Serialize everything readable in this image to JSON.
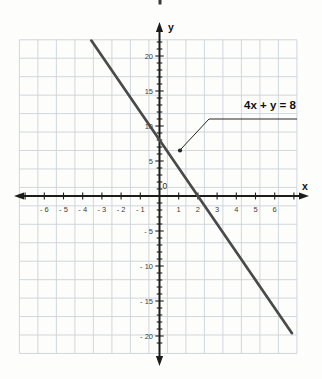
{
  "page": {
    "background": "#fdfdfb"
  },
  "chart_data": {
    "type": "line",
    "title": "",
    "equation_label": "4x + y = 8",
    "xlabel": "x",
    "ylabel": "y",
    "origin_label": "0",
    "grid": true,
    "x_axis": {
      "min": -7.5,
      "max": 7.7,
      "tick_step": 1,
      "labeled_ticks": [
        -6,
        -5,
        -4,
        -3,
        -2,
        -1,
        1,
        2,
        3,
        4,
        5,
        6
      ],
      "tick_label_texts": [
        "- 6",
        "- 5",
        "- 4",
        "- 3",
        "- 2",
        "- 1",
        "1",
        "2",
        "3",
        "4",
        "5",
        "6"
      ]
    },
    "y_axis": {
      "min": -23,
      "max": 24,
      "tick_step": 1,
      "label_step": 5,
      "labeled_ticks": [
        20,
        15,
        10,
        5,
        -5,
        -10,
        -15,
        -20
      ],
      "tick_label_texts": [
        "20",
        "15",
        "10",
        "5",
        "- 5",
        "- 10",
        "- 15",
        "- 20"
      ]
    },
    "series": [
      {
        "name": "4x + y = 8",
        "equation": "y = 8 - 4x",
        "slope": -4,
        "intercept": 8,
        "x_range": [
          -3.55,
          6.9
        ],
        "key_points": [
          {
            "x": 0,
            "y": 8,
            "note": "y-intercept"
          },
          {
            "x": 2,
            "y": 0,
            "note": "x-intercept"
          }
        ],
        "color": "#4a4a4a"
      }
    ],
    "annotation": {
      "text": "4x + y = 8",
      "points_to": {
        "x": 1,
        "y": 6
      }
    },
    "legend": null,
    "colors": {
      "grid": "#ccd2d9",
      "axis": "#1c1c1c",
      "tick_label": "#3d3d3d",
      "line": "#4a4a4a",
      "annotation_text": "#101010",
      "leader": "#262626"
    }
  }
}
